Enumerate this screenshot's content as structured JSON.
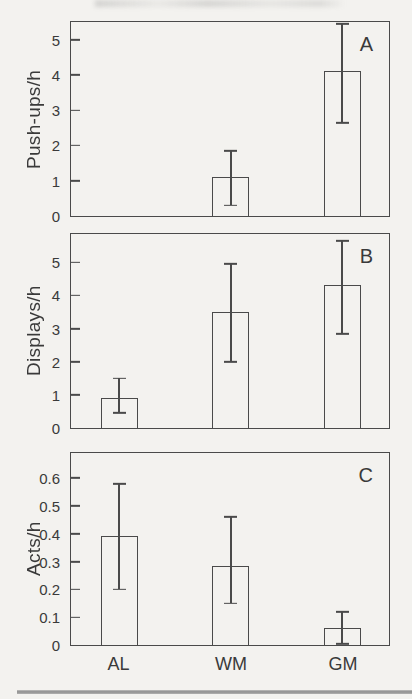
{
  "chart_data": [
    {
      "type": "bar",
      "panel_label": "A",
      "ylabel": "Push-ups/h",
      "categories": [
        "AL",
        "WM",
        "GM"
      ],
      "values": [
        0,
        1.1,
        4.1
      ],
      "error_low": [
        null,
        0.3,
        2.65
      ],
      "error_high": [
        null,
        1.85,
        5.45
      ],
      "ylim": [
        0,
        5.5
      ],
      "yticks": [
        0,
        1,
        2,
        3,
        4,
        5
      ],
      "ytick_labels": [
        "0",
        "1",
        "2",
        "3",
        "4",
        "5"
      ],
      "legend": "none",
      "grid": false
    },
    {
      "type": "bar",
      "panel_label": "B",
      "ylabel": "Displays/h",
      "categories": [
        "AL",
        "WM",
        "GM"
      ],
      "values": [
        0.9,
        3.5,
        4.3
      ],
      "error_low": [
        0.45,
        2.0,
        2.85
      ],
      "error_high": [
        1.5,
        4.95,
        5.65
      ],
      "ylim": [
        0,
        5.85
      ],
      "yticks": [
        0,
        1,
        2,
        3,
        4,
        5
      ],
      "ytick_labels": [
        "0",
        "1",
        "2",
        "3",
        "4",
        "5"
      ],
      "legend": "none",
      "grid": false
    },
    {
      "type": "bar",
      "panel_label": "C",
      "ylabel": "Acts/h",
      "categories": [
        "AL",
        "WM",
        "GM"
      ],
      "values": [
        0.39,
        0.285,
        0.06
      ],
      "error_low": [
        0.2,
        0.15,
        0.005
      ],
      "error_high": [
        0.58,
        0.46,
        0.12
      ],
      "ylim": [
        0,
        0.69
      ],
      "yticks": [
        0,
        0.1,
        0.2,
        0.3,
        0.4,
        0.5,
        0.6
      ],
      "ytick_labels": [
        "0",
        "0.1",
        "0.2",
        "0.3",
        "0.4",
        "0.5",
        "0.6"
      ],
      "legend": "none",
      "grid": false
    }
  ],
  "x_axis": {
    "categories": [
      "AL",
      "WM",
      "GM"
    ]
  },
  "colors": {
    "line": "#4a4a4a",
    "text": "#3a3a3a",
    "paper": "#f3f2ef",
    "rule": "#8f8f8f"
  }
}
